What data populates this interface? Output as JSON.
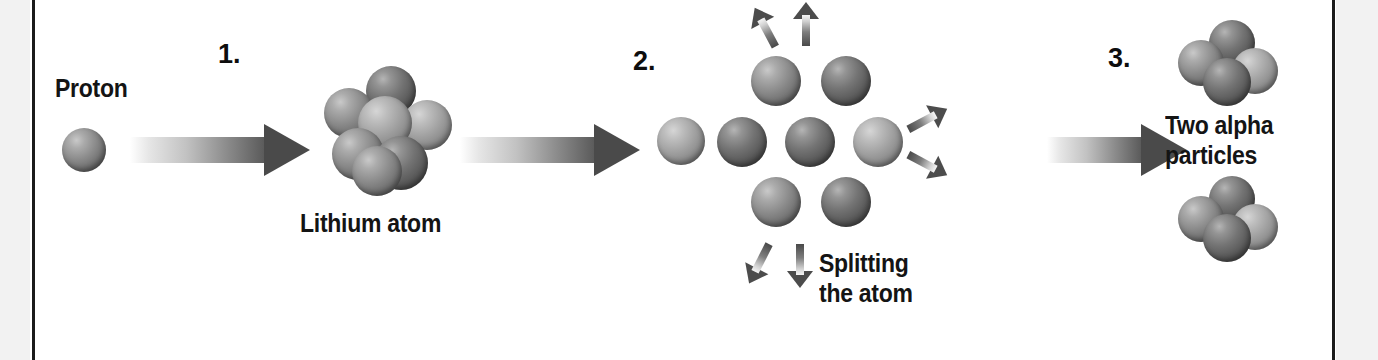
{
  "diagram": {
    "frame_color": "#1b1b1b",
    "page_background": "#ffffff",
    "margin_color": "#f2f2f2",
    "sphere_color": "#8e8e8e",
    "arrow_color": "#4a4a4a"
  },
  "steps": [
    {
      "number": "1.",
      "caption": "Splitting stage one"
    },
    {
      "number": "2.",
      "caption": "Splitting stage two"
    },
    {
      "number": "3.",
      "caption": "Splitting stage three"
    }
  ],
  "labels": {
    "proton": "Proton",
    "lithium_atom": "Lithium atom",
    "splitting_the_atom": "Splitting\nthe atom",
    "two_alpha_particles": "Two alpha\nparticles"
  },
  "particles": {
    "proton_count": 1,
    "lithium_nucleon_count": 7,
    "splitting_nucleon_count": 7,
    "alpha_particle_count": 2,
    "nucleons_per_alpha": 4
  }
}
